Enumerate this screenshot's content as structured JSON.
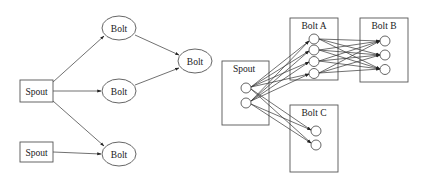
{
  "left_diagram": {
    "nodes": {
      "spout1": {
        "label": "Spout",
        "type": "spout",
        "x": 36,
        "y": 91
      },
      "spout2": {
        "label": "Spout",
        "type": "spout",
        "x": 36,
        "y": 152
      },
      "bolt_top": {
        "label": "Bolt",
        "type": "bolt",
        "x": 119,
        "y": 28
      },
      "bolt_mid": {
        "label": "Bolt",
        "type": "bolt",
        "x": 119,
        "y": 91
      },
      "bolt_bot": {
        "label": "Bolt",
        "type": "bolt",
        "x": 119,
        "y": 154
      },
      "bolt_right": {
        "label": "Bolt",
        "type": "bolt",
        "x": 195,
        "y": 61
      }
    },
    "edges": [
      [
        "spout1",
        "bolt_top"
      ],
      [
        "spout1",
        "bolt_mid"
      ],
      [
        "spout1",
        "bolt_bot"
      ],
      [
        "spout2",
        "bolt_bot"
      ],
      [
        "bolt_top",
        "bolt_right"
      ],
      [
        "bolt_mid",
        "bolt_right"
      ]
    ]
  },
  "right_diagram": {
    "components": {
      "spout": {
        "label": "Spout",
        "tasks": 2
      },
      "bolt_a": {
        "label": "Bolt A",
        "tasks": 4
      },
      "bolt_b": {
        "label": "Bolt B",
        "tasks": 3
      },
      "bolt_c": {
        "label": "Bolt C",
        "tasks": 2
      }
    },
    "groupings": [
      {
        "from": "spout",
        "to": "bolt_a",
        "pattern": "all-to-all"
      },
      {
        "from": "spout",
        "to": "bolt_c",
        "pattern": "all-to-all"
      },
      {
        "from": "bolt_a",
        "to": "bolt_b",
        "pattern": "all-to-all"
      }
    ]
  },
  "colors": {
    "stroke": "#555555",
    "edge": "#333333",
    "text": "#222222",
    "background": "#ffffff"
  }
}
